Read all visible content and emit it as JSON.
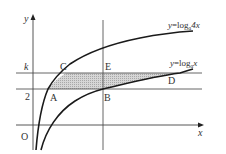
{
  "diagram": {
    "axes": {
      "x_label": "x",
      "y_label": "y",
      "origin_label": "O"
    },
    "horizontal_lines": [
      {
        "label": "k",
        "meaning": "y=k"
      },
      {
        "label": "2",
        "meaning": "y=2"
      }
    ],
    "curves": [
      {
        "label": "y=logₐ 4x",
        "label_parts": {
          "lhs": "y",
          "eq": "=log",
          "sub": "a",
          "rhs": "4x"
        }
      },
      {
        "label": "y=logₐ x",
        "label_parts": {
          "lhs": "y",
          "eq": "=log",
          "sub": "a",
          "rhs": "x"
        }
      }
    ],
    "points": [
      {
        "name": "A",
        "desc": "intersection of y=log_a 4x and y=2"
      },
      {
        "name": "B",
        "desc": "intersection of y=log_a x and y=2"
      },
      {
        "name": "C",
        "desc": "intersection of y=log_a 4x and y=k"
      },
      {
        "name": "D",
        "desc": "intersection of y=log_a x and y=k"
      },
      {
        "name": "E",
        "desc": "point on y=k directly above B"
      }
    ],
    "shaded_region": "ACDB",
    "colors": {
      "line": "#333333",
      "curve": "#1a1a1a",
      "shade": "#c8c8c8",
      "background": "#ffffff"
    }
  }
}
